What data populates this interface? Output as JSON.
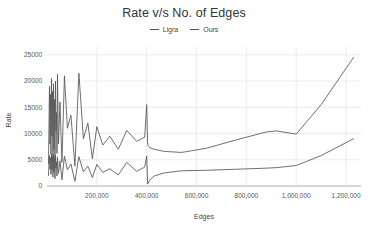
{
  "chart_data": {
    "type": "line",
    "title": "Rate v/s No. of Edges",
    "xlabel": "Edges",
    "ylabel": "Rate",
    "xlim": [
      0,
      1260000
    ],
    "ylim": [
      0,
      26500
    ],
    "grid": true,
    "legend_position": "top-center",
    "xticks": [
      200000,
      400000,
      600000,
      800000,
      1000000,
      1200000
    ],
    "xtick_labels": [
      "200,000",
      "400,000",
      "600,000",
      "800,000",
      "1,000,000",
      "1,200,000"
    ],
    "yticks": [
      0,
      5000,
      10000,
      15000,
      20000,
      25000
    ],
    "ytick_labels": [
      "0",
      "5000",
      "10000",
      "15000",
      "20000",
      "25000"
    ],
    "series": [
      {
        "name": "Ligra",
        "color": "#555555",
        "x": [
          6000,
          8000,
          10000,
          12000,
          14000,
          16000,
          18000,
          20000,
          22000,
          24000,
          26000,
          28000,
          30000,
          32000,
          34000,
          36000,
          38000,
          40000,
          42000,
          46000,
          52000,
          60000,
          70000,
          82000,
          96000,
          112000,
          128000,
          146000,
          164000,
          182000,
          200000,
          224000,
          252000,
          286000,
          320000,
          360000,
          392000,
          400000,
          404000,
          412000,
          430000,
          470000,
          540000,
          640000,
          760000,
          880000,
          920000,
          1000000,
          1100000,
          1230000
        ],
        "y": [
          4300,
          12000,
          19000,
          8000,
          17500,
          6000,
          20500,
          9500,
          18000,
          5500,
          19500,
          7000,
          16500,
          4800,
          20000,
          10500,
          14000,
          6200,
          21300,
          8000,
          16000,
          4500,
          21000,
          11000,
          13500,
          3800,
          21500,
          9000,
          12000,
          5200,
          11300,
          7800,
          9500,
          7000,
          10600,
          8500,
          9300,
          15500,
          7900,
          7300,
          7000,
          6600,
          6400,
          7200,
          8800,
          10300,
          10500,
          9900,
          15500,
          24500
        ]
      },
      {
        "name": "Ours",
        "color": "#555555",
        "x": [
          6000,
          8000,
          10000,
          12000,
          14000,
          16000,
          18000,
          20000,
          22000,
          24000,
          26000,
          28000,
          30000,
          32000,
          34000,
          36000,
          38000,
          40000,
          42000,
          46000,
          52000,
          60000,
          70000,
          82000,
          96000,
          112000,
          128000,
          146000,
          164000,
          182000,
          200000,
          224000,
          252000,
          286000,
          320000,
          360000,
          392000,
          400000,
          404000,
          412000,
          430000,
          470000,
          540000,
          640000,
          760000,
          880000,
          920000,
          1000000,
          1100000,
          1230000
        ],
        "y": [
          2000,
          4500,
          5800,
          3200,
          5400,
          2200,
          6100,
          3000,
          5600,
          1700,
          6000,
          2600,
          5200,
          1400,
          5900,
          3400,
          4600,
          1900,
          5500,
          2400,
          4800,
          1200,
          5700,
          3100,
          4200,
          900,
          5600,
          2700,
          3800,
          1600,
          4100,
          2600,
          3300,
          2100,
          4500,
          2800,
          3600,
          5700,
          400,
          1100,
          1900,
          2500,
          2900,
          3000,
          3200,
          3400,
          3500,
          3900,
          5800,
          9000
        ]
      }
    ]
  },
  "legend": {
    "items": [
      {
        "label": "Ligra"
      },
      {
        "label": "Ours"
      }
    ]
  }
}
